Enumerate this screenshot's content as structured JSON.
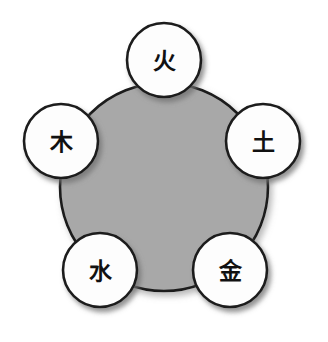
{
  "diagram": {
    "type": "radial-node-diagram",
    "background_color": "#ffffff",
    "center_shape": {
      "name": "center-disc",
      "shape": "circle",
      "fill_color": "#a8a8a8",
      "stroke_color": "#1c1c1c",
      "cx": 164,
      "cy": 187,
      "r": 104,
      "stroke_width": 2.6,
      "label": ""
    },
    "node_style": {
      "fill_color": "#fdfdfd",
      "stroke_color": "#1c1c1c",
      "stroke_width": 2.6,
      "radius": 37,
      "shadow_color": "#8a8a8a",
      "label_font_size": 23
    },
    "nodes": [
      {
        "id": "fire",
        "label": "火",
        "romanization": "",
        "position": "top",
        "cx": 164,
        "cy": 60
      },
      {
        "id": "earth",
        "label": "土",
        "romanization": "",
        "position": "right",
        "cx": 263,
        "cy": 141
      },
      {
        "id": "metal",
        "label": "金",
        "romanization": "",
        "position": "bottom-right",
        "cx": 230,
        "cy": 270
      },
      {
        "id": "water",
        "label": "水",
        "romanization": "",
        "position": "bottom-left",
        "cx": 100,
        "cy": 270
      },
      {
        "id": "wood",
        "label": "木",
        "romanization": "",
        "position": "left",
        "cx": 61,
        "cy": 141
      }
    ]
  }
}
